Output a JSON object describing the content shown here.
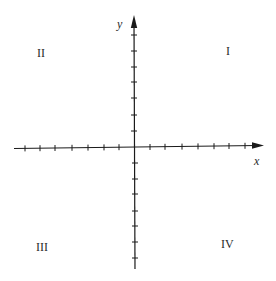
{
  "diagram": {
    "axes": {
      "x": {
        "label": "x",
        "ticks_negative": 7,
        "ticks_positive": 7,
        "arrow": "right"
      },
      "y": {
        "label": "y",
        "ticks_positive": 7,
        "ticks_negative": 7,
        "arrow": "up"
      }
    },
    "quadrants": {
      "I": "I",
      "II": "II",
      "III": "III",
      "IV": "IV"
    },
    "colors": {
      "axis": "#1a1a1a",
      "background": "#ffffff",
      "text": "#2a2a2a"
    }
  }
}
